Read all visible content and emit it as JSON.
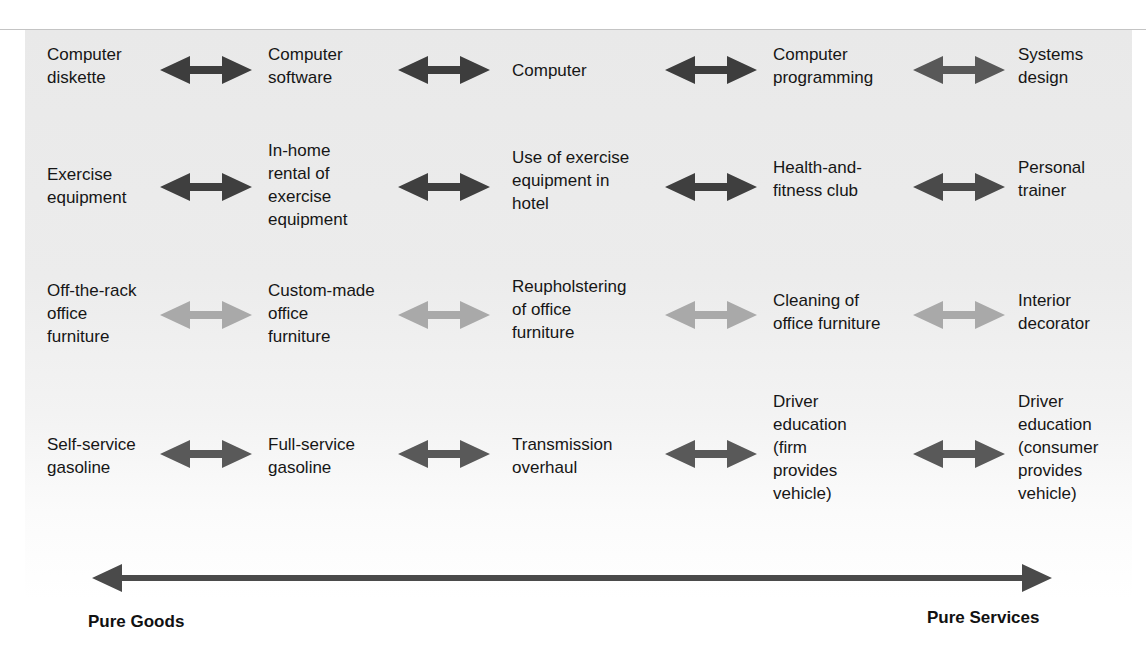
{
  "diagram": {
    "title": "",
    "rows": [
      {
        "id": "computers",
        "arrow_color": [
          "#3d3d3d",
          "#3d3d3d",
          "#3d3d3d",
          "#585858"
        ],
        "items": [
          "Computer\ndiskette",
          "Computer\nsoftware",
          "Computer",
          "Computer\nprogramming",
          "Systems\ndesign"
        ]
      },
      {
        "id": "exercise",
        "arrow_color": [
          "#3f3f3f",
          "#3f3f3f",
          "#3f3f3f",
          "#4a4a4a"
        ],
        "items": [
          "Exercise\nequipment",
          "In-home\nrental of\nexercise\nequipment",
          "Use of exercise\nequipment in\nhotel",
          "Health-and-\nfitness club",
          "Personal\ntrainer"
        ]
      },
      {
        "id": "office-furniture",
        "arrow_color": [
          "#a9a9a9",
          "#a9a9a9",
          "#a9a9a9",
          "#a9a9a9"
        ],
        "items": [
          "Off-the-rack\noffice\nfurniture",
          "Custom-made\noffice\nfurniture",
          "Reupholstering\nof office\nfurniture",
          "Cleaning of\noffice furniture",
          "Interior\ndecorator"
        ]
      },
      {
        "id": "automotive",
        "arrow_color": [
          "#595959",
          "#595959",
          "#595959",
          "#595959"
        ],
        "items": [
          "Self-service\ngasoline",
          "Full-service\ngasoline",
          "Transmission\noverhaul",
          "Driver\neducation\n(firm\nprovides\nvehicle)",
          "Driver\neducation\n(consumer\nprovides\nvehicle)"
        ]
      }
    ],
    "axis": {
      "left_label": "Pure Goods",
      "right_label": "Pure Services",
      "color": "#4a4a4a"
    }
  }
}
